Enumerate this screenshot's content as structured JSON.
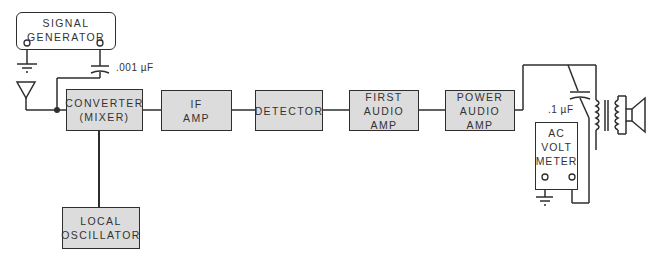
{
  "diagram": {
    "type": "block-diagram",
    "blocks": {
      "signal_generator": {
        "lines": [
          "SIGNAL",
          "GENERATOR"
        ]
      },
      "converter": {
        "lines": [
          "CONVERTER",
          "(MIXER)"
        ]
      },
      "local_oscillator": {
        "lines": [
          "LOCAL",
          "OSCILLATOR"
        ]
      },
      "if_amp": {
        "lines": [
          "IF",
          "AMP"
        ]
      },
      "detector": {
        "lines": [
          "DETECTOR"
        ]
      },
      "first_audio_amp": {
        "lines": [
          "FIRST",
          "AUDIO",
          "AMP"
        ]
      },
      "power_audio_amp": {
        "lines": [
          "POWER",
          "AUDIO",
          "AMP"
        ]
      },
      "ac_volt_meter": {
        "lines": [
          "AC",
          "VOLT",
          "METER"
        ]
      }
    },
    "components": {
      "input_capacitor": {
        "label": ".001 µF"
      },
      "output_capacitor": {
        "label": ".1 µF"
      },
      "antenna": "antenna-symbol",
      "ground_symbols": 2,
      "output_transformer": "transformer-symbol",
      "speaker": "speaker-symbol"
    },
    "connections": [
      [
        "signal_generator",
        "input_capacitor"
      ],
      [
        "input_capacitor",
        "converter"
      ],
      [
        "antenna",
        "converter"
      ],
      [
        "local_oscillator",
        "converter"
      ],
      [
        "converter",
        "if_amp"
      ],
      [
        "if_amp",
        "detector"
      ],
      [
        "detector",
        "first_audio_amp"
      ],
      [
        "first_audio_amp",
        "power_audio_amp"
      ],
      [
        "power_audio_amp",
        "output_transformer"
      ],
      [
        "output_transformer",
        "speaker"
      ],
      [
        "output_capacitor",
        "ac_volt_meter"
      ]
    ],
    "colors": {
      "block_fill": "#dcdcdc",
      "line": "#2e2e2e"
    }
  }
}
